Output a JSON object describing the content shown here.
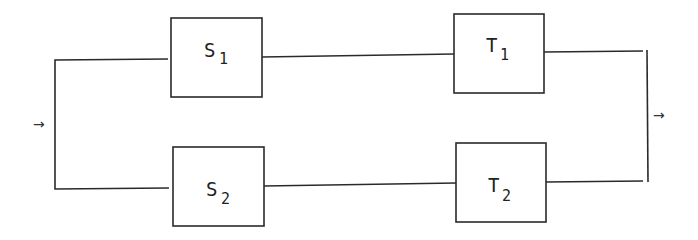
{
  "diagram": {
    "type": "series-parallel block diagram",
    "input_arrow": "→",
    "output_arrow": "→",
    "blocks": [
      {
        "id": "S1",
        "letter": "S",
        "subscript": "1",
        "row": "top",
        "column": "left"
      },
      {
        "id": "T1",
        "letter": "T",
        "subscript": "1",
        "row": "top",
        "column": "right"
      },
      {
        "id": "S2",
        "letter": "S",
        "subscript": "2",
        "row": "bottom",
        "column": "left"
      },
      {
        "id": "T2",
        "letter": "T",
        "subscript": "2",
        "row": "bottom",
        "column": "right"
      }
    ],
    "connections": [
      [
        "input",
        "S1"
      ],
      [
        "input",
        "S2"
      ],
      [
        "S1",
        "T1"
      ],
      [
        "S2",
        "T2"
      ],
      [
        "T1",
        "output"
      ],
      [
        "T2",
        "output"
      ]
    ],
    "colors": {
      "line": "#2a2a2a",
      "background": "#ffffff"
    }
  }
}
